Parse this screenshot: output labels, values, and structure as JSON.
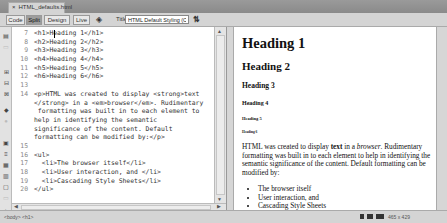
{
  "document_tab": {
    "close": "×",
    "filename": "HTML_defaults.html"
  },
  "toolbar": {
    "views": [
      {
        "label": "Code",
        "active": false
      },
      {
        "label": "Split",
        "active": true
      },
      {
        "label": "Design",
        "active": false
      },
      {
        "label": "Live",
        "active": false
      }
    ],
    "title_label": "Title:",
    "title_value": "HTML Default Styling (CSS)"
  },
  "code": {
    "lines": [
      {
        "n": "7",
        "text": "<h1>Heading 1</h1>"
      },
      {
        "n": "8",
        "text": "<h2>Heading 2</h2>"
      },
      {
        "n": "9",
        "text": "<h3>Heading 3</h3>"
      },
      {
        "n": "10",
        "text": "<h4>Heading 4</h4>"
      },
      {
        "n": "11",
        "text": "<h5>Heading 5</h5>"
      },
      {
        "n": "12",
        "text": "<h6>Heading 6</h6>"
      },
      {
        "n": "13",
        "text": ""
      },
      {
        "n": "14",
        "text": "<p>HTML was created to display <strong>text"
      },
      {
        "n": "",
        "text": "</strong> in a <em>browser</em>. Rudimentary"
      },
      {
        "n": "",
        "text": " formatting was built in to each element to"
      },
      {
        "n": "",
        "text": "help in identifying the semantic"
      },
      {
        "n": "",
        "text": "significance of the content. Default"
      },
      {
        "n": "",
        "text": "formatting can be modified by:</p>"
      },
      {
        "n": "15",
        "text": ""
      },
      {
        "n": "16",
        "text": "<ul>"
      },
      {
        "n": "17",
        "text": "  <li>The browser itself</li>"
      },
      {
        "n": "18",
        "text": "  <li>User interaction, and </li>"
      },
      {
        "n": "19",
        "text": "  <li>Cascading Style Sheets</li>"
      },
      {
        "n": "20",
        "text": "</ul>"
      }
    ]
  },
  "preview": {
    "h1": "Heading 1",
    "h2": "Heading 2",
    "h3": "Heading 3",
    "h4": "Heading 4",
    "h5": "Heading 5",
    "h6": "Heading 6",
    "para_before": "HTML was created to display ",
    "para_strong": "text",
    "para_mid": " in a ",
    "para_em": "browser",
    "para_after": ". Rudimentary formatting was built in to each element to help in identifying the semantic significance of the content. Default formatting can be modified by:",
    "list": [
      "The browser itself",
      "User interaction, and",
      "Cascading Style Sheets"
    ]
  },
  "statusbar": {
    "tag_selector": "<body> <h1>",
    "window_size": "465 x 429"
  }
}
